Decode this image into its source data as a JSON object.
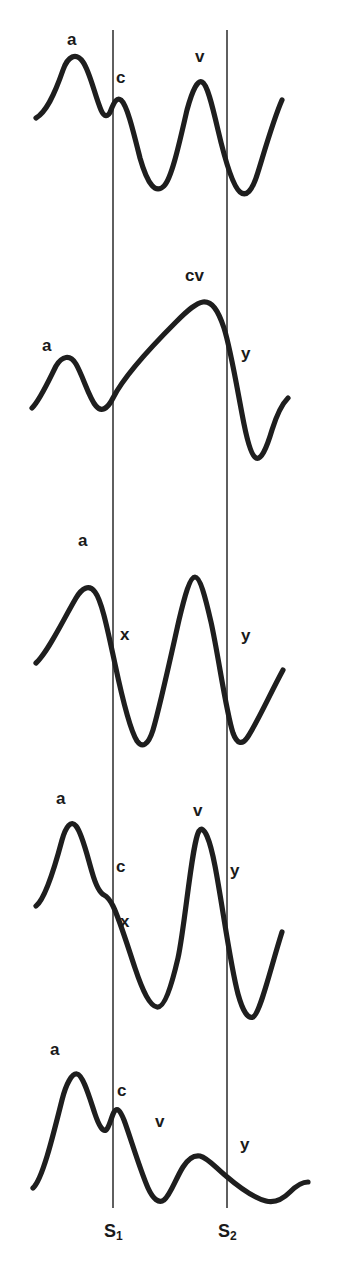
{
  "figure": {
    "background_color": "#ffffff",
    "stroke_color": "#1e1e1e",
    "timing_line_color": "#2a2a2a",
    "width": 344,
    "height": 1272
  },
  "timing_lines": [
    {
      "id": "s1",
      "label": "S",
      "subscript": "1",
      "x": 113,
      "y_top": 30,
      "y_bottom": 1208,
      "label_x": 104,
      "label_y": 1222
    },
    {
      "id": "s2",
      "label": "S",
      "subscript": "2",
      "x": 227,
      "y_top": 30,
      "y_bottom": 1208,
      "label_x": 218,
      "label_y": 1222
    }
  ],
  "panels": [
    {
      "id": "panel-1",
      "name": "normal-jvp",
      "labels": [
        {
          "text": "a",
          "x": 67,
          "y": 31
        },
        {
          "text": "c",
          "x": 116,
          "y": 69
        },
        {
          "text": "v",
          "x": 195,
          "y": 48
        }
      ],
      "path": "M 36,118 C 46,112 54,96 63,70 C 68,56 76,52 83,62 C 90,72 95,96 101,110 C 104,117 108,118 111,110 C 114,102 117,97 121,100 C 127,105 133,130 140,158 C 148,186 156,194 164,186 C 172,178 180,140 187,110 C 193,88 198,80 202,82 C 207,84 212,104 218,130 C 225,160 233,186 240,192 C 246,197 252,192 258,172 C 266,146 274,118 282,100"
    },
    {
      "id": "panel-2",
      "name": "tricuspid-regurgitation-cv-wave",
      "labels": [
        {
          "text": "a",
          "x": 42,
          "y": 337
        },
        {
          "text": "cv",
          "x": 185,
          "y": 267
        },
        {
          "text": "y",
          "x": 241,
          "y": 345
        }
      ],
      "path": "M 32,408 C 40,400 48,382 56,366 C 62,356 70,354 76,364 C 83,376 89,398 96,406 C 101,412 107,410 113,398 C 124,376 150,348 176,322 C 188,310 196,303 203,302 C 212,301 218,310 224,328 C 231,350 238,394 244,424 C 248,444 252,456 256,458 C 261,460 266,450 272,430 C 277,414 282,404 288,398"
    },
    {
      "id": "panel-3",
      "name": "prominent-x-and-y-descents",
      "labels": [
        {
          "text": "a",
          "x": 78,
          "y": 532
        },
        {
          "text": "x",
          "x": 120,
          "y": 626
        },
        {
          "text": "y",
          "x": 241,
          "y": 627
        }
      ],
      "path": "M 36,663 C 48,652 62,622 76,598 C 82,588 89,584 95,592 C 102,601 108,632 115,664 C 122,697 130,730 137,741 C 142,748 148,746 153,730 C 160,706 170,660 179,620 C 185,595 190,577 195,577 C 200,577 205,596 211,622 C 218,653 226,712 233,733 C 237,744 242,745 247,738 C 256,725 270,694 283,670"
    },
    {
      "id": "panel-4",
      "name": "c-and-x-with-v-wave",
      "labels": [
        {
          "text": "a",
          "x": 56,
          "y": 790
        },
        {
          "text": "c",
          "x": 116,
          "y": 858
        },
        {
          "text": "v",
          "x": 193,
          "y": 802
        },
        {
          "text": "x",
          "x": 120,
          "y": 913
        },
        {
          "text": "y",
          "x": 230,
          "y": 862
        }
      ],
      "path": "M 36,906 C 44,900 54,870 62,840 C 66,826 71,820 76,826 C 82,833 87,855 92,872 C 96,886 100,893 104,895 C 108,897 110,900 113,906 C 119,918 127,944 135,968 C 143,992 150,1006 157,1007 C 164,1008 171,988 178,958 C 185,926 192,842 199,831 C 204,824 210,840 215,866 C 222,902 230,964 238,994 C 243,1012 248,1019 253,1017 C 260,1014 270,970 282,932"
    },
    {
      "id": "panel-5",
      "name": "blunted-v-with-slow-y-descent",
      "labels": [
        {
          "text": "a",
          "x": 50,
          "y": 1041
        },
        {
          "text": "c",
          "x": 117,
          "y": 1082
        },
        {
          "text": "v",
          "x": 155,
          "y": 1113
        },
        {
          "text": "y",
          "x": 240,
          "y": 1136
        }
      ],
      "path": "M 33,1188 C 42,1180 52,1140 62,1100 C 66,1084 72,1073 77,1074 C 83,1075 89,1096 95,1114 C 99,1126 103,1132 106,1130 C 109,1128 111,1118 114,1112 C 117,1107 120,1110 124,1120 C 130,1136 140,1170 148,1188 C 153,1199 159,1204 164,1200 C 170,1196 176,1178 183,1167 C 188,1159 194,1155 200,1156 C 208,1158 216,1168 226,1176 C 240,1188 254,1198 266,1201 C 274,1203 282,1200 290,1192 C 296,1186 302,1182 308,1182"
    }
  ]
}
